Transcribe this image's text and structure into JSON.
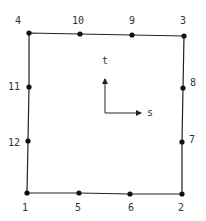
{
  "diagram": {
    "colors": {
      "line": "#222222",
      "node": "#111111",
      "text": "#333333"
    },
    "nodes": [
      {
        "id": "1",
        "x": 27,
        "y": 193,
        "lx": 22,
        "ly": 211
      },
      {
        "id": "2",
        "x": 182,
        "y": 194,
        "lx": 178,
        "ly": 211
      },
      {
        "id": "3",
        "x": 184,
        "y": 36,
        "lx": 180,
        "ly": 24
      },
      {
        "id": "4",
        "x": 29,
        "y": 33,
        "lx": 15,
        "ly": 24
      },
      {
        "id": "5",
        "x": 79,
        "y": 193,
        "lx": 75,
        "ly": 211
      },
      {
        "id": "6",
        "x": 130,
        "y": 194,
        "lx": 128,
        "ly": 211
      },
      {
        "id": "7",
        "x": 182,
        "y": 142,
        "lx": 189,
        "ly": 143
      },
      {
        "id": "8",
        "x": 183,
        "y": 88,
        "lx": 190,
        "ly": 86
      },
      {
        "id": "9",
        "x": 132,
        "y": 35,
        "lx": 129,
        "ly": 24
      },
      {
        "id": "10",
        "x": 80,
        "y": 34,
        "lx": 72,
        "ly": 24
      },
      {
        "id": "11",
        "x": 29,
        "y": 87,
        "lx": 8,
        "ly": 90
      },
      {
        "id": "12",
        "x": 28,
        "y": 141,
        "lx": 8,
        "ly": 146
      }
    ],
    "axes": {
      "origin": {
        "x": 105,
        "y": 113
      },
      "s": {
        "label": "s",
        "x2": 141,
        "y2": 113,
        "lx": 147,
        "ly": 116
      },
      "t": {
        "label": "t",
        "x2": 105,
        "y2": 79,
        "lx": 102,
        "ly": 64
      }
    }
  }
}
